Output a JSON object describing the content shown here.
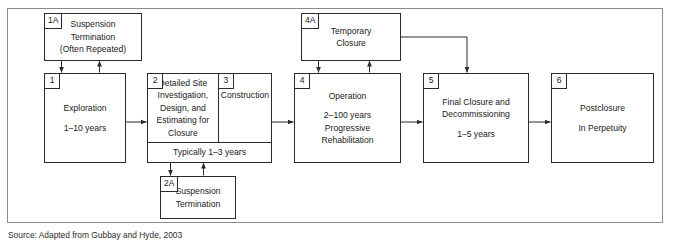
{
  "figure": {
    "type": "flowchart",
    "source_caption": "Source: Adapted from Gubbay and Hyde, 2003"
  },
  "nodes": {
    "n1a": {
      "tag": "1A",
      "line1": "Suspension\nTermination\n(Often Repeated)"
    },
    "n1": {
      "tag": "1",
      "line1": "Exploration",
      "line2": "1–10 years"
    },
    "n2": {
      "tag": "2",
      "line1": "Detailed Site\nInvestigation,\nDesign, and\nEstimating for\nClosure"
    },
    "n3": {
      "tag": "3",
      "line1": "Construction"
    },
    "n23_footer": {
      "text": "Typically 1–3 years"
    },
    "n2a": {
      "tag": "2A",
      "line1": "Suspension\nTermination"
    },
    "n4a": {
      "tag": "4A",
      "line1": "Temporary\nClosure"
    },
    "n4": {
      "tag": "4",
      "line1": "Operation",
      "line2": "2–100 years\nProgressive\nRehabilitation"
    },
    "n5": {
      "tag": "5",
      "line1": "Final Closure and\nDecommissioning",
      "line2": "1–5 years"
    },
    "n6": {
      "tag": "6",
      "line1": "Postclosure",
      "line2": "In Perpetuity"
    }
  },
  "connectors": [
    {
      "name": "arrow-1a-to-1",
      "from": "1A",
      "to": "1",
      "direction": "down"
    },
    {
      "name": "arrow-1-to-1a",
      "from": "1",
      "to": "1A",
      "direction": "up"
    },
    {
      "name": "arrow-1-to-2",
      "from": "1",
      "to": "2",
      "direction": "right"
    },
    {
      "name": "arrow-23-to-2a",
      "from": "2/3",
      "to": "2A",
      "direction": "down"
    },
    {
      "name": "arrow-2a-to-23",
      "from": "2A",
      "to": "2/3",
      "direction": "up"
    },
    {
      "name": "arrow-3-to-4",
      "from": "3",
      "to": "4",
      "direction": "right"
    },
    {
      "name": "arrow-4a-to-4",
      "from": "4A",
      "to": "4",
      "direction": "down"
    },
    {
      "name": "arrow-4-to-4a",
      "from": "4",
      "to": "4A",
      "direction": "up"
    },
    {
      "name": "arrow-4a-to-5",
      "from": "4A",
      "to": "5",
      "direction": "right-then-down"
    },
    {
      "name": "arrow-4-to-5",
      "from": "4",
      "to": "5",
      "direction": "right"
    },
    {
      "name": "arrow-5-to-6",
      "from": "5",
      "to": "6",
      "direction": "right"
    }
  ],
  "colors": {
    "frame_border": "#8c8c8c",
    "box_border": "#2b2b2b",
    "text": "#1a1a1a",
    "background": "#ffffff"
  }
}
